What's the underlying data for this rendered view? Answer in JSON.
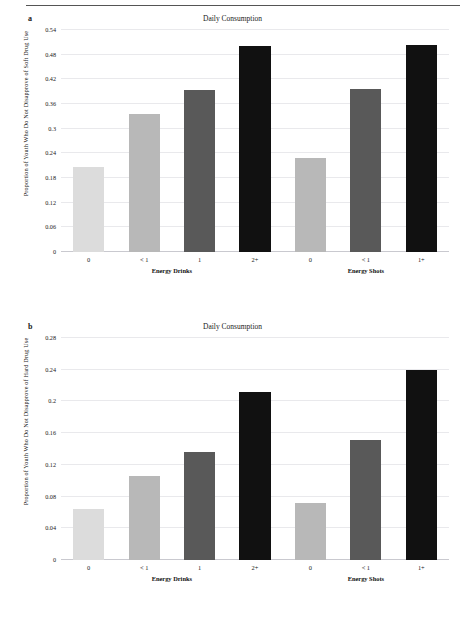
{
  "figure": {
    "panels": [
      {
        "letter": "a",
        "title": "Daily Consumption",
        "ylabel": "Proportion of Youth Who Do Not Disapprove of Soft Drug Use"
      },
      {
        "letter": "b",
        "title": "Daily Consumption",
        "ylabel": "Proportion of Youth Who Do Not Disapprove of Hard Drug Use"
      }
    ]
  },
  "palette": {
    "bar_light": "#dcdcdc",
    "bar_medium_light": "#b8b8b8",
    "bar_dark": "#595959",
    "bar_black": "#111111",
    "gridline": "#e9e9ec",
    "axis": "#c9c9cf"
  },
  "chart_data": [
    {
      "type": "bar",
      "panel": "a",
      "title": "Daily Consumption",
      "xlabel": "",
      "ylabel": "Proportion of Youth Who Do Not Disapprove of Soft Drug Use",
      "ylim": [
        0,
        0.54
      ],
      "ytick_values": [
        0,
        0.06,
        0.12,
        0.18,
        0.24,
        0.3,
        0.36,
        0.42,
        0.48,
        0.54
      ],
      "ytick_labels": [
        "0",
        "0.06",
        "0.12",
        "0.18",
        "0.24",
        "0.3",
        "0.36",
        "0.42",
        "0.48",
        "0.54"
      ],
      "grid": true,
      "legend": "none",
      "categories": [
        "0",
        "< 1",
        "1",
        "2+",
        "0",
        "< 1",
        "1+"
      ],
      "values": [
        0.207,
        0.336,
        0.393,
        0.502,
        0.228,
        0.397,
        0.504
      ],
      "bar_colors": [
        "#dcdcdc",
        "#b8b8b8",
        "#595959",
        "#111111",
        "#b8b8b8",
        "#595959",
        "#111111"
      ],
      "groups": [
        {
          "label": "Energy Drinks",
          "start": 0,
          "end": 3
        },
        {
          "label": "Energy Shots",
          "start": 4,
          "end": 6
        }
      ]
    },
    {
      "type": "bar",
      "panel": "b",
      "title": "Daily Consumption",
      "xlabel": "",
      "ylabel": "Proportion of Youth Who Do Not Disapprove of Hard Drug Use",
      "ylim": [
        0,
        0.28
      ],
      "ytick_values": [
        0,
        0.04,
        0.08,
        0.12,
        0.16,
        0.2,
        0.24,
        0.28
      ],
      "ytick_labels": [
        "0",
        "0.04",
        "0.08",
        "0.12",
        "0.16",
        "0.2",
        "0.24",
        "0.28"
      ],
      "grid": true,
      "legend": "none",
      "categories": [
        "0",
        "< 1",
        "1",
        "2+",
        "0",
        "< 1",
        "1+"
      ],
      "values": [
        0.064,
        0.106,
        0.136,
        0.212,
        0.072,
        0.152,
        0.24
      ],
      "bar_colors": [
        "#dcdcdc",
        "#b8b8b8",
        "#595959",
        "#111111",
        "#b8b8b8",
        "#595959",
        "#111111"
      ],
      "groups": [
        {
          "label": "Energy Drinks",
          "start": 0,
          "end": 3
        },
        {
          "label": "Energy Shots",
          "start": 4,
          "end": 6
        }
      ]
    }
  ]
}
